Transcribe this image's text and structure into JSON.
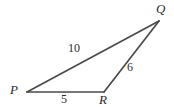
{
  "figure": {
    "background_color": "#ffffff",
    "stroke_color": "#4a4a4a",
    "text_color": "#2b2b2b"
  },
  "vertices": [
    {
      "id": "P",
      "label": "P",
      "x": 27,
      "y": 92,
      "label_x": 10,
      "label_y": 83
    },
    {
      "id": "Q",
      "label": "Q",
      "x": 159,
      "y": 21,
      "label_x": 156,
      "label_y": 2
    },
    {
      "id": "R",
      "label": "R",
      "x": 104,
      "y": 92,
      "label_x": 99,
      "label_y": 93
    }
  ],
  "sides": [
    {
      "id": "PQ",
      "from": "P",
      "to": "Q",
      "length_label": "10",
      "label_x": 68,
      "label_y": 42
    },
    {
      "id": "RQ",
      "from": "R",
      "to": "Q",
      "length_label": "6",
      "label_x": 127,
      "label_y": 61
    },
    {
      "id": "PR",
      "from": "P",
      "to": "R",
      "length_label": "5",
      "label_x": 61,
      "label_y": 93
    }
  ]
}
